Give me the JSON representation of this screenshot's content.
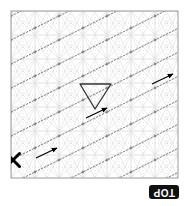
{
  "figure": {
    "title": "",
    "orientation_label": "TOP",
    "background_color": "#ffffff",
    "frame": {
      "x": 11,
      "y": 11,
      "width": 167,
      "height": 167,
      "stroke_color": "#9a9a9a",
      "stroke_width": 1
    },
    "grid": {
      "cell_size": 24,
      "cols": 7,
      "rows": 7,
      "line_color": "#d8d8d8",
      "dotted_line_color": "#cfcfcf",
      "cell_diagonal_color": "#e2e2e2",
      "grid_on": true
    },
    "trajectories": {
      "count": 7,
      "color": "#6e6e6e",
      "style": "dotted",
      "slope": -0.5,
      "node_marker_color": "#808080",
      "description": "parallel dotted diagonal paths running lower-left to upper-right"
    },
    "markers": {
      "start": {
        "name": "x-marker",
        "label": "X",
        "x": 13,
        "y": 160,
        "color": "#000000",
        "size": 13
      },
      "triangle": {
        "name": "triangle-marker",
        "orientation": "down",
        "x1": 80,
        "y1": 84,
        "x2": 111,
        "y2": 84,
        "x3": 95,
        "y3": 109,
        "color": "#333333",
        "stroke_width": 1.3
      },
      "arrows": [
        {
          "name": "arrow-bottom-left",
          "x1": 36,
          "y1": 158,
          "x2": 57,
          "y2": 148,
          "color": "#000000"
        },
        {
          "name": "arrow-center",
          "x1": 86,
          "y1": 118,
          "x2": 107,
          "y2": 108,
          "color": "#000000"
        },
        {
          "name": "arrow-right",
          "x1": 152,
          "y1": 84,
          "x2": 173,
          "y2": 74,
          "color": "#000000"
        }
      ]
    }
  }
}
